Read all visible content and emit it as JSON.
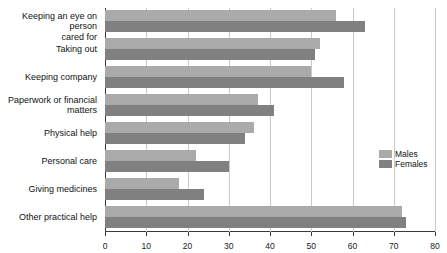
{
  "chart_data": {
    "type": "bar",
    "orientation": "horizontal",
    "title": "",
    "xlabel": "",
    "ylabel": "",
    "xlim": [
      0,
      80
    ],
    "xticks": [
      0,
      10,
      20,
      30,
      40,
      50,
      60,
      70,
      80
    ],
    "grid": true,
    "legend_position": "right",
    "categories": [
      "Keeping an eye on person\ncared for",
      "Taking out",
      "Keeping company",
      "Paperwork or financial\nmatters",
      "Physical help",
      "Personal care",
      "Giving medicines",
      "Other practical help"
    ],
    "series": [
      {
        "name": "Males",
        "color": "#aaaaaa",
        "values": [
          56,
          52,
          50,
          37,
          36,
          22,
          18,
          72
        ]
      },
      {
        "name": "Females",
        "color": "#808080",
        "values": [
          63,
          51,
          58,
          41,
          34,
          30,
          24,
          73
        ]
      }
    ]
  },
  "legend": {
    "items": [
      {
        "label": "Males"
      },
      {
        "label": "Females"
      }
    ]
  },
  "axis": {
    "tick_labels": [
      "0",
      "10",
      "20",
      "30",
      "40",
      "50",
      "60",
      "70",
      "80"
    ]
  }
}
